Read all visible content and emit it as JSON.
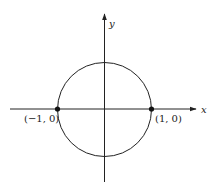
{
  "diagram": {
    "type": "unit-circle",
    "colors": {
      "stroke": "#222222",
      "background": "#ffffff"
    },
    "axes": {
      "x_label": "x",
      "y_label": "y"
    },
    "circle": {
      "center": [
        0,
        0
      ],
      "radius": 1
    },
    "points": [
      {
        "label": "(−1, 0)",
        "coords": [
          -1,
          0
        ]
      },
      {
        "label": "(1, 0)",
        "coords": [
          1,
          0
        ]
      }
    ]
  }
}
